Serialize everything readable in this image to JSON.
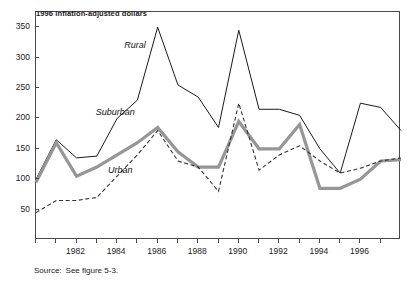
{
  "header": {
    "unit_note": "1996 inflation-adjusted dollars"
  },
  "footer": {
    "source_label": "Source:",
    "source_text": "See figure 5-3."
  },
  "series_labels": {
    "rural": "Rural",
    "suburban": "Suburban",
    "urban": "Urban"
  },
  "colors": {
    "rural": "#1a1a1a",
    "suburban": "#969696",
    "urban": "#333333",
    "axis": "#4a4a4a",
    "text": "#1a1a1a"
  },
  "axis": {
    "y_ticks": [
      50,
      100,
      150,
      200,
      250,
      300,
      350
    ],
    "y_tick_labels": [
      "50",
      "100",
      "150",
      "200",
      "250",
      "300",
      "350"
    ],
    "x_ticks": [
      1980,
      1981,
      1982,
      1983,
      1984,
      1985,
      1986,
      1987,
      1988,
      1989,
      1990,
      1991,
      1992,
      1993,
      1994,
      1995,
      1996,
      1997
    ],
    "x_tick_labels_shown": [
      "1982",
      "1984",
      "1986",
      "1988",
      "1990",
      "1992",
      "1994",
      "1996"
    ],
    "x_labeled_years": [
      1982,
      1984,
      1986,
      1988,
      1990,
      1992,
      1994,
      1996
    ]
  },
  "chart_data": {
    "type": "line",
    "title": "",
    "subtitle": "",
    "xlabel": "",
    "ylabel": "1996 inflation-adjusted dollars",
    "xlim": [
      1980,
      1998
    ],
    "ylim": [
      0,
      375
    ],
    "grid": false,
    "legend": "inline-annotations",
    "x": [
      1980,
      1981,
      1982,
      1983,
      1984,
      1985,
      1986,
      1987,
      1988,
      1989,
      1990,
      1991,
      1992,
      1993,
      1994,
      1995,
      1996,
      1997,
      1998
    ],
    "series": [
      {
        "name": "Rural",
        "style": "thin-solid",
        "color": "#1a1a1a",
        "values": [
          100,
          165,
          135,
          138,
          200,
          230,
          350,
          255,
          235,
          185,
          345,
          215,
          215,
          205,
          150,
          110,
          225,
          218,
          180
        ]
      },
      {
        "name": "Suburban",
        "style": "thick-solid-gray",
        "color": "#969696",
        "values": [
          95,
          160,
          105,
          120,
          140,
          160,
          185,
          145,
          120,
          120,
          195,
          150,
          150,
          190,
          85,
          85,
          100,
          130,
          132
        ]
      },
      {
        "name": "Urban",
        "style": "dashed",
        "color": "#333333",
        "values": [
          45,
          65,
          65,
          70,
          105,
          140,
          180,
          130,
          120,
          80,
          225,
          115,
          140,
          155,
          130,
          110,
          118,
          130,
          135
        ]
      }
    ],
    "annotations": [
      {
        "text": "Rural",
        "x": 1984.4,
        "y": 318
      },
      {
        "text": "Suburban",
        "x": 1983.0,
        "y": 208
      },
      {
        "text": "Urban",
        "x": 1983.6,
        "y": 112
      }
    ]
  }
}
